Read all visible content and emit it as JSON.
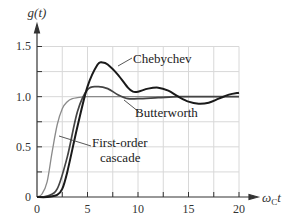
{
  "chart_data": {
    "type": "line",
    "title": "",
    "xlabel": "ω_C t",
    "ylabel": "g(t)",
    "xlim": [
      0,
      20
    ],
    "ylim": [
      0,
      1.5
    ],
    "grid": true,
    "legend": "none (inline annotations)",
    "x_ticks": [
      0,
      5,
      10,
      15,
      20
    ],
    "x_tick_labels": [
      "0",
      "5",
      "10",
      "15",
      "20"
    ],
    "y_ticks": [
      0,
      0.5,
      1.0,
      1.5
    ],
    "y_tick_labels": [
      "0",
      "0.5",
      "1.0",
      "1.5"
    ],
    "series": [
      {
        "name": "Chebychev",
        "color": "#1a1a1a",
        "x": [
          0,
          1,
          2,
          2.5,
          3,
          4,
          5,
          6,
          6.5,
          7,
          8,
          9,
          9.5,
          10,
          11,
          12,
          13,
          14,
          15,
          16,
          17,
          18,
          19,
          20
        ],
        "values": [
          0,
          0.0,
          0.02,
          0.08,
          0.25,
          0.7,
          1.1,
          1.32,
          1.34,
          1.32,
          1.22,
          1.09,
          1.05,
          1.05,
          1.08,
          1.09,
          1.06,
          1.0,
          0.95,
          0.93,
          0.94,
          0.98,
          1.02,
          1.04
        ]
      },
      {
        "name": "Butterworth",
        "color": "#444444",
        "x": [
          0,
          1,
          2,
          3,
          4,
          5,
          6,
          7,
          8,
          9,
          10,
          12,
          14,
          16,
          18,
          20
        ],
        "values": [
          0,
          0.01,
          0.08,
          0.4,
          0.85,
          1.07,
          1.1,
          1.08,
          1.02,
          0.98,
          0.98,
          0.99,
          1.0,
          1.0,
          1.0,
          1.0
        ]
      },
      {
        "name": "First-order cascade",
        "color": "#8a8a8a",
        "x": [
          0,
          0.5,
          1,
          1.5,
          2,
          2.5,
          3,
          3.5,
          4,
          5,
          6,
          8,
          10,
          15,
          20
        ],
        "values": [
          0,
          0.03,
          0.15,
          0.45,
          0.72,
          0.88,
          0.95,
          0.98,
          0.99,
          1.0,
          1.0,
          1.0,
          1.0,
          1.0,
          1.0
        ]
      }
    ],
    "annotations": [
      {
        "text": "Chebychev",
        "target_series": "Chebychev"
      },
      {
        "text": "Butterworth",
        "target_series": "Butterworth"
      },
      {
        "text": "First-order cascade",
        "lines": [
          "First-order",
          "cascade"
        ],
        "target_series": "First-order cascade"
      }
    ]
  },
  "labels": {
    "y_axis": "g(t)",
    "x_axis_main": "ω",
    "x_axis_sub": "C",
    "x_axis_tail": "t",
    "chebychev": "Chebychev",
    "butterworth": "Butterworth",
    "first_order_1": "First-order",
    "first_order_2": "cascade",
    "ytick_0": "0",
    "ytick_05": "0.5",
    "ytick_10": "1.0",
    "ytick_15": "1.5",
    "xtick_0": "0",
    "xtick_5": "5",
    "xtick_10": "10",
    "xtick_15": "15",
    "xtick_20": "20"
  }
}
